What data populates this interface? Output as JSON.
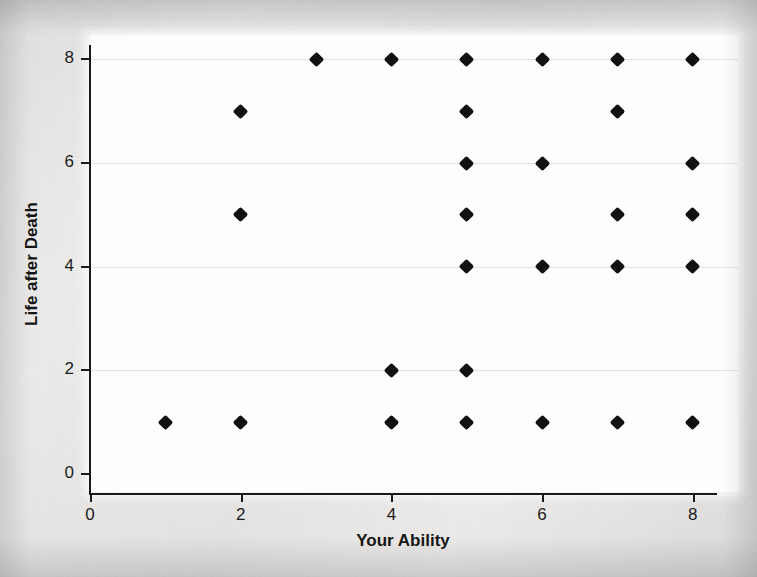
{
  "chart_data": {
    "type": "scatter",
    "title": "",
    "xlabel": "Your Ability",
    "ylabel": "Life after Death",
    "xlim": [
      0,
      8.6
    ],
    "ylim": [
      -0.35,
      8.45
    ],
    "xticks": [
      0,
      2,
      4,
      6,
      8
    ],
    "xtick_labels": [
      "0",
      "2",
      "4",
      "6",
      "8"
    ],
    "yticks": [
      0,
      2,
      4,
      6,
      8
    ],
    "ytick_labels": [
      "0",
      "2",
      "4",
      "6",
      "8"
    ],
    "grid": "horizontal",
    "legend": "none",
    "marker": "diamond",
    "marker_color": "#111111",
    "points": [
      {
        "x": 3,
        "y": 8
      },
      {
        "x": 4,
        "y": 8
      },
      {
        "x": 5,
        "y": 8
      },
      {
        "x": 6,
        "y": 8
      },
      {
        "x": 7,
        "y": 8
      },
      {
        "x": 8,
        "y": 8
      },
      {
        "x": 2,
        "y": 7
      },
      {
        "x": 5,
        "y": 7
      },
      {
        "x": 7,
        "y": 7
      },
      {
        "x": 5,
        "y": 6
      },
      {
        "x": 6,
        "y": 6
      },
      {
        "x": 8,
        "y": 6
      },
      {
        "x": 2,
        "y": 5
      },
      {
        "x": 5,
        "y": 5
      },
      {
        "x": 7,
        "y": 5
      },
      {
        "x": 8,
        "y": 5
      },
      {
        "x": 5,
        "y": 4
      },
      {
        "x": 6,
        "y": 4
      },
      {
        "x": 7,
        "y": 4
      },
      {
        "x": 8,
        "y": 4
      },
      {
        "x": 4,
        "y": 2
      },
      {
        "x": 5,
        "y": 2
      },
      {
        "x": 1,
        "y": 1
      },
      {
        "x": 2,
        "y": 1
      },
      {
        "x": 4,
        "y": 1
      },
      {
        "x": 5,
        "y": 1
      },
      {
        "x": 6,
        "y": 1
      },
      {
        "x": 7,
        "y": 1
      },
      {
        "x": 8,
        "y": 1
      }
    ],
    "gridline_values": [
      2,
      4,
      6,
      8
    ],
    "colors": {
      "page_background": "#e6e5e3",
      "plot_background": "#fdfdfd",
      "axis": "#1a1a1a",
      "gridline": "#cfcfcf",
      "text": "#141414"
    }
  }
}
